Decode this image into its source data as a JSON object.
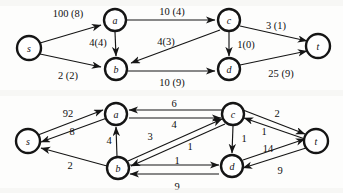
{
  "figure": {
    "caption": "",
    "background_color": "#fdfdfc",
    "ink_color": "#151515"
  },
  "graphs": [
    {
      "id": "flow-network-top",
      "name": "flow-network-with-capacity-and-flow",
      "label_format": "capacity (flow)",
      "nodes": [
        {
          "id": "s",
          "label": "s",
          "x": 29,
          "y": 48,
          "r": 12
        },
        {
          "id": "a",
          "label": "a",
          "x": 115,
          "y": 20,
          "r": 11
        },
        {
          "id": "b",
          "label": "b",
          "x": 116,
          "y": 69,
          "r": 11
        },
        {
          "id": "c",
          "label": "c",
          "x": 229,
          "y": 20,
          "r": 11
        },
        {
          "id": "d",
          "label": "d",
          "x": 229,
          "y": 69,
          "r": 11
        },
        {
          "id": "t",
          "label": "t",
          "x": 318,
          "y": 46,
          "r": 12
        }
      ],
      "edges": [
        {
          "from": "s",
          "to": "a",
          "label": "100 (8)",
          "capacity": 100,
          "flow": 8,
          "lx": 68,
          "ly": 13
        },
        {
          "from": "s",
          "to": "b",
          "label": "2 (2)",
          "capacity": 2,
          "flow": 2,
          "lx": 68,
          "ly": 75
        },
        {
          "from": "a",
          "to": "c",
          "label": "10 (4)",
          "capacity": 10,
          "flow": 4,
          "lx": 172,
          "ly": 11
        },
        {
          "from": "a",
          "to": "b",
          "label": "4(4)",
          "capacity": 4,
          "flow": 4,
          "lx": 98,
          "ly": 42
        },
        {
          "from": "c",
          "to": "b",
          "label": "4(3)",
          "capacity": 4,
          "flow": 3,
          "lx": 166,
          "ly": 41
        },
        {
          "from": "c",
          "to": "t",
          "label": "3 (1)",
          "capacity": 3,
          "flow": 1,
          "lx": 276,
          "ly": 25
        },
        {
          "from": "c",
          "to": "d",
          "label": "1(0)",
          "capacity": 1,
          "flow": 0,
          "lx": 246,
          "ly": 44
        },
        {
          "from": "b",
          "to": "d",
          "label": "10 (9)",
          "capacity": 10,
          "flow": 9,
          "lx": 172,
          "ly": 82
        },
        {
          "from": "d",
          "to": "t",
          "label": "25 (9)",
          "capacity": 25,
          "flow": 9,
          "lx": 281,
          "ly": 73
        }
      ]
    },
    {
      "id": "residual-network-bottom",
      "name": "residual-network-with-residual-capacities",
      "label_format": "residual capacity",
      "nodes": [
        {
          "id": "s",
          "label": "s",
          "x": 28,
          "y": 141,
          "r": 12
        },
        {
          "id": "a",
          "label": "a",
          "x": 116,
          "y": 114,
          "r": 11
        },
        {
          "id": "b",
          "label": "b",
          "x": 118,
          "y": 168,
          "r": 11
        },
        {
          "id": "c",
          "label": "c",
          "x": 233,
          "y": 114,
          "r": 11
        },
        {
          "id": "d",
          "label": "d",
          "x": 232,
          "y": 166,
          "r": 11
        },
        {
          "id": "t",
          "label": "t",
          "x": 316,
          "y": 141,
          "r": 12
        }
      ],
      "edges": [
        {
          "from": "s",
          "to": "a",
          "label": "92",
          "value": 92,
          "lx": 68,
          "ly": 113
        },
        {
          "from": "a",
          "to": "s",
          "label": "8",
          "value": 8,
          "lx": 72,
          "ly": 131
        },
        {
          "from": "b",
          "to": "s",
          "label": "2",
          "value": 2,
          "lx": 70,
          "ly": 165
        },
        {
          "from": "b",
          "to": "a",
          "label": "4",
          "value": 4,
          "lx": 109,
          "ly": 140
        },
        {
          "from": "c",
          "to": "a",
          "label": "6",
          "value": 6,
          "lx": 174,
          "ly": 103
        },
        {
          "from": "a",
          "to": "c",
          "label": "4",
          "value": 4,
          "lx": 174,
          "ly": 124
        },
        {
          "from": "b",
          "to": "c",
          "label": "3",
          "value": 3,
          "lx": 150,
          "ly": 136
        },
        {
          "from": "c",
          "to": "b",
          "label": "1",
          "value": 1,
          "lx": 190,
          "ly": 146
        },
        {
          "from": "c",
          "to": "t",
          "label": "2",
          "value": 2,
          "lx": 277,
          "ly": 113
        },
        {
          "from": "t",
          "to": "c",
          "label": "1",
          "value": 1,
          "lx": 264,
          "ly": 131
        },
        {
          "from": "c",
          "to": "d",
          "label": "1",
          "value": 1,
          "lx": 244,
          "ly": 138
        },
        {
          "from": "b",
          "to": "d",
          "label": "1",
          "value": 1,
          "lx": 177,
          "ly": 160
        },
        {
          "from": "d",
          "to": "b",
          "label": "9",
          "value": 9,
          "lx": 177,
          "ly": 186
        },
        {
          "from": "d",
          "to": "t",
          "label": "14",
          "value": 14,
          "lx": 268,
          "ly": 148
        },
        {
          "from": "t",
          "to": "d",
          "label": "9",
          "value": 9,
          "lx": 280,
          "ly": 170
        }
      ]
    }
  ]
}
